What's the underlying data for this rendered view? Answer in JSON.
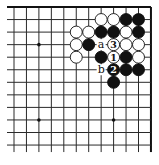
{
  "diagram": {
    "type": "go-board-corner",
    "board": {
      "columns": 12,
      "rows": 12,
      "origin_x": 14,
      "origin_y": 7,
      "spacing_x": 12.45,
      "spacing_y": 12.55,
      "extend_left": 7,
      "extend_bottom": 7,
      "edge_top": true,
      "edge_right": true,
      "line_color": "#2a2a2a",
      "edge_color": "#111111",
      "stone_radius": 6
    },
    "star_points": [
      {
        "col": 2,
        "row": 3
      },
      {
        "col": 2,
        "row": 9
      },
      {
        "col": 8,
        "row": 9
      }
    ],
    "stones": [
      {
        "col": 7,
        "row": 1,
        "color": "white"
      },
      {
        "col": 8,
        "row": 1,
        "color": "white"
      },
      {
        "col": 9,
        "row": 1,
        "color": "black"
      },
      {
        "col": 10,
        "row": 1,
        "color": "black"
      },
      {
        "col": 5,
        "row": 2,
        "color": "white"
      },
      {
        "col": 6,
        "row": 2,
        "color": "white"
      },
      {
        "col": 7,
        "row": 2,
        "color": "black"
      },
      {
        "col": 8,
        "row": 2,
        "color": "black"
      },
      {
        "col": 9,
        "row": 2,
        "color": "white"
      },
      {
        "col": 10,
        "row": 2,
        "color": "black"
      },
      {
        "col": 5,
        "row": 3,
        "color": "white"
      },
      {
        "col": 6,
        "row": 3,
        "color": "black"
      },
      {
        "col": 8,
        "row": 3,
        "color": "white",
        "label": "3"
      },
      {
        "col": 9,
        "row": 3,
        "color": "white"
      },
      {
        "col": 10,
        "row": 3,
        "color": "white"
      },
      {
        "col": 5,
        "row": 4,
        "color": "white"
      },
      {
        "col": 7,
        "row": 4,
        "color": "black"
      },
      {
        "col": 8,
        "row": 4,
        "color": "white",
        "label": "1"
      },
      {
        "col": 9,
        "row": 4,
        "color": "black"
      },
      {
        "col": 10,
        "row": 4,
        "color": "white"
      },
      {
        "col": 8,
        "row": 5,
        "color": "black",
        "label": "2"
      },
      {
        "col": 9,
        "row": 5,
        "color": "black"
      },
      {
        "col": 10,
        "row": 5,
        "color": "black"
      },
      {
        "col": 8,
        "row": 6,
        "color": "black"
      }
    ],
    "point_labels": [
      {
        "col": 7,
        "row": 3,
        "text": "a"
      },
      {
        "col": 7,
        "row": 5,
        "text": "b"
      }
    ]
  }
}
